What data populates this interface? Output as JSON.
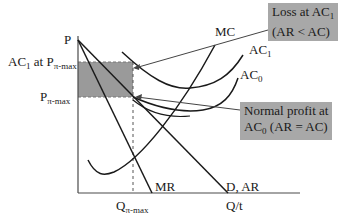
{
  "diagram": {
    "type": "economics-cost-revenue",
    "colors": {
      "shade": "#9a9a9a",
      "line": "#1a1a1a",
      "box": "#a8a8a8",
      "axis": "#4a4a4a"
    },
    "axes": {
      "y_label": "P",
      "x_label": "Q/t"
    },
    "price_labels": {
      "ac1_at_p": {
        "main": "AC",
        "sub1": "1",
        "mid": " at P",
        "sub2": "π-max"
      },
      "p_max": {
        "main": "P",
        "sub": "π-max"
      }
    },
    "quantity_label": {
      "main": "Q",
      "sub": "π-max"
    },
    "curve_labels": {
      "mc": "MC",
      "ac1": {
        "main": "AC",
        "sub": "1"
      },
      "ac0": {
        "main": "AC",
        "sub": "0"
      },
      "mr": "MR",
      "demand": "D, AR"
    },
    "callouts": {
      "loss": {
        "line1_main": "Loss at AC",
        "line1_sub": "1",
        "line2": "(AR < AC)"
      },
      "normal": {
        "line1": "Normal profit at",
        "line2_main": "AC",
        "line2_sub": "0",
        "line2_rest": " (AR = AC)"
      }
    }
  }
}
